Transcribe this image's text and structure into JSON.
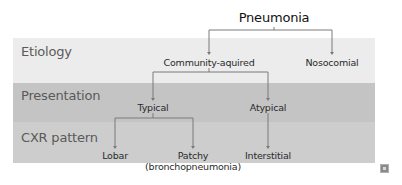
{
  "diagram": {
    "title": "Pneumonia",
    "rows": [
      {
        "id": "etiology",
        "label": "Etiology",
        "color": "#ececec"
      },
      {
        "id": "presentation",
        "label": "Presentation",
        "color": "#c4c4c4"
      },
      {
        "id": "cxr",
        "label": "CXR pattern",
        "color": "#cdcdcd"
      }
    ],
    "nodes": {
      "root": "Pneumonia",
      "community": "Community-aquired",
      "nosocomial": "Nosocomial",
      "typical": "Typical",
      "atypical": "Atypical",
      "lobar": "Lobar",
      "patchy": "Patchy",
      "patchy_sub": "(bronchopneumonia)",
      "interstitial": "Interstitial"
    },
    "edges": [
      {
        "from": "Pneumonia",
        "to": "Community-aquired"
      },
      {
        "from": "Pneumonia",
        "to": "Nosocomial"
      },
      {
        "from": "Community-aquired",
        "to": "Typical"
      },
      {
        "from": "Community-aquired",
        "to": "Atypical"
      },
      {
        "from": "Typical",
        "to": "Lobar"
      },
      {
        "from": "Typical",
        "to": "Patchy (bronchopneumonia)"
      },
      {
        "from": "Atypical",
        "to": "Interstitial"
      }
    ],
    "line_color": "#7a7a7a",
    "corner_icon": "expand-icon"
  }
}
